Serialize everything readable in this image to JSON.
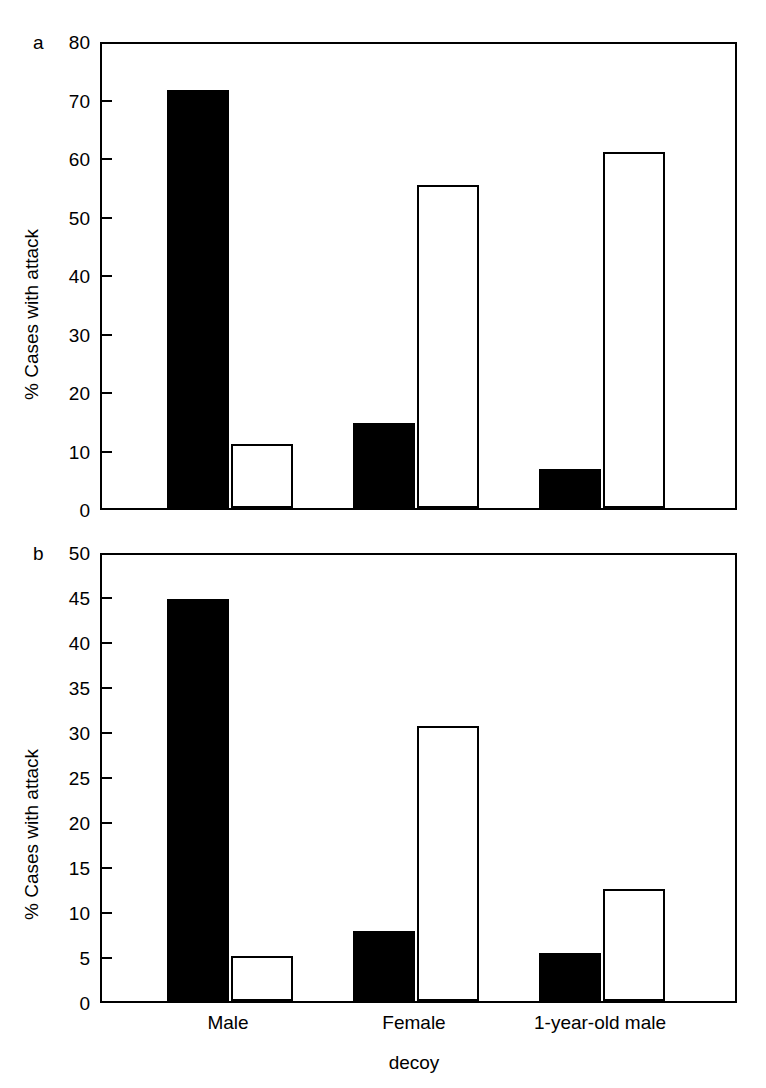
{
  "figure": {
    "panel_a_letter": "a",
    "panel_b_letter": "b",
    "xlabel": "decoy",
    "ylabel": "% Cases with attack"
  },
  "chart_data": [
    {
      "panel": "a",
      "type": "bar",
      "title": "",
      "xlabel": "decoy",
      "ylabel": "% Cases with attack",
      "ylim": [
        0,
        80
      ],
      "yticks": [
        0,
        10,
        20,
        30,
        40,
        50,
        60,
        70,
        80
      ],
      "ytick_labels": [
        "0",
        "10",
        "20",
        "30",
        "40",
        "50",
        "60",
        "70",
        "80"
      ],
      "grid": false,
      "legend": "none",
      "categories": [
        "Male",
        "Female",
        "1-year-old male"
      ],
      "series": [
        {
          "name": "filled",
          "fill": "#000000",
          "values": [
            71.5,
            14.5,
            6.7
          ]
        },
        {
          "name": "open",
          "fill": "#ffffff",
          "values": [
            11.0,
            55.3,
            60.8
          ]
        }
      ]
    },
    {
      "panel": "b",
      "type": "bar",
      "title": "",
      "xlabel": "decoy",
      "ylabel": "% Cases with attack",
      "ylim": [
        0,
        50
      ],
      "yticks": [
        0,
        5,
        10,
        15,
        20,
        25,
        30,
        35,
        40,
        45,
        50
      ],
      "ytick_labels": [
        "0",
        "5",
        "10",
        "15",
        "20",
        "25",
        "30",
        "35",
        "40",
        "45",
        "50"
      ],
      "grid": false,
      "legend": "none",
      "categories": [
        "Male",
        "Female",
        "1-year-old male"
      ],
      "series": [
        {
          "name": "filled",
          "fill": "#000000",
          "values": [
            44.7,
            7.8,
            5.3
          ]
        },
        {
          "name": "open",
          "fill": "#ffffff",
          "values": [
            5.0,
            30.6,
            12.5
          ]
        }
      ]
    }
  ],
  "panel_a": {
    "letter": "a",
    "ylabel": "% Cases with attack",
    "yticks": [
      "0",
      "10",
      "20",
      "30",
      "40",
      "50",
      "60",
      "70",
      "80"
    ]
  },
  "panel_b": {
    "letter": "b",
    "ylabel": "% Cases with attack",
    "yticks": [
      "0",
      "5",
      "10",
      "15",
      "20",
      "25",
      "30",
      "35",
      "40",
      "45",
      "50"
    ],
    "xticks": [
      "Male",
      "Female",
      "1-year-old male"
    ],
    "xlabel": "decoy"
  }
}
